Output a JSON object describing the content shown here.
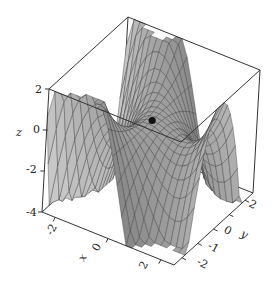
{
  "chart_data": {
    "type": "surface3d",
    "title": "",
    "xlabel": "x",
    "ylabel": "y",
    "zlabel": "z",
    "xlim": [
      -2.5,
      2.5
    ],
    "ylim": [
      -2.5,
      2.5
    ],
    "zlim": [
      -4,
      2
    ],
    "x_ticks": [
      -2,
      0,
      2
    ],
    "y_ticks": [
      -2,
      -1,
      0,
      2
    ],
    "z_ticks": [
      -4,
      -2,
      0,
      2
    ],
    "surface": "z = x^2*y - x^2 ... (saddle-shaped surface with a critical point at origin)",
    "marked_point": {
      "x": 0,
      "y": 0,
      "z": 0,
      "style": "black dot"
    },
    "reference_line": {
      "description": "dashed line at z = 0 from the z-axis to the marked point"
    },
    "mesh": "wireframe grid over gray shaded surface",
    "box": true
  },
  "labels": {
    "z_ticks": [
      "2",
      "0",
      "-2",
      "-4"
    ],
    "x_ticks": [
      "-2",
      "0",
      "2"
    ],
    "y_ticks": [
      "-2",
      "-1",
      "0",
      "2"
    ],
    "x_name": "x",
    "y_name": "y",
    "z_name": "z"
  },
  "colors": {
    "line": "#333333",
    "surface_light": "#c8c8c8",
    "surface_dark": "#7a7a7a",
    "mesh": "#3a3a3a",
    "dot": "#111111"
  }
}
